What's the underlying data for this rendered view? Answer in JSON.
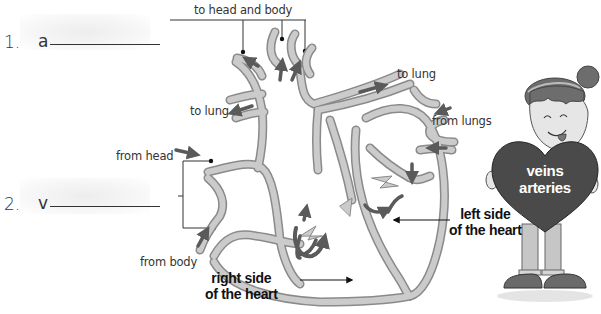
{
  "worksheet": {
    "answers": [
      {
        "number": "1.",
        "letter": "a"
      },
      {
        "number": "2.",
        "letter": "v"
      }
    ],
    "labels": {
      "to_head_and_body": "to head and body",
      "to_lung_right": "to lung",
      "to_lung_left": "to lung",
      "from_lungs": "from lungs",
      "from_head": "from head",
      "from_body": "from body",
      "right_side_line1": "right side",
      "right_side_line2": "of the heart",
      "left_side_line1": "left side",
      "left_side_line2": "of the heart"
    },
    "character": {
      "heart_word_1": "veins",
      "heart_word_2": "arteries"
    },
    "colors": {
      "vessel_fill": "#c8c8c8",
      "vessel_outline": "#8a8a8a",
      "arrow": "#5a5a5a",
      "heart_sign": "#4a4a4a",
      "text": "#222222"
    }
  }
}
